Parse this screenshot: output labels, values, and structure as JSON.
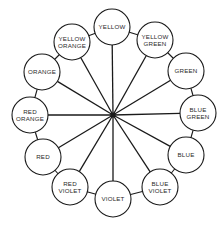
{
  "diagram": {
    "hub": {
      "x": 113,
      "y": 115
    },
    "circle_radius": 18,
    "stroke_color": "#1a1a1a",
    "nodes": [
      {
        "id": "yellow",
        "lines": [
          "YELLOW"
        ],
        "x": 112,
        "y": 27
      },
      {
        "id": "yellow-green",
        "lines": [
          "YELLOW",
          "GREEN"
        ],
        "x": 155,
        "y": 40
      },
      {
        "id": "green",
        "lines": [
          "GREEN"
        ],
        "x": 186,
        "y": 71
      },
      {
        "id": "blue-green",
        "lines": [
          "BLUE",
          "GREEN"
        ],
        "x": 198,
        "y": 113
      },
      {
        "id": "blue",
        "lines": [
          "BLUE"
        ],
        "x": 186,
        "y": 155
      },
      {
        "id": "blue-violet",
        "lines": [
          "BLUE",
          "VIOLET"
        ],
        "x": 160,
        "y": 187
      },
      {
        "id": "violet",
        "lines": [
          "VIOLET"
        ],
        "x": 113,
        "y": 199
      },
      {
        "id": "red-violet",
        "lines": [
          "RED",
          "VIOLET"
        ],
        "x": 70,
        "y": 187
      },
      {
        "id": "red",
        "lines": [
          "RED"
        ],
        "x": 43,
        "y": 157
      },
      {
        "id": "red-orange",
        "lines": [
          "RED",
          "ORANGE"
        ],
        "x": 30,
        "y": 115
      },
      {
        "id": "orange",
        "lines": [
          "ORANGE"
        ],
        "x": 42,
        "y": 72
      },
      {
        "id": "yellow-orange",
        "lines": [
          "YELLOW",
          "ORANGE"
        ],
        "x": 72,
        "y": 42
      }
    ]
  }
}
